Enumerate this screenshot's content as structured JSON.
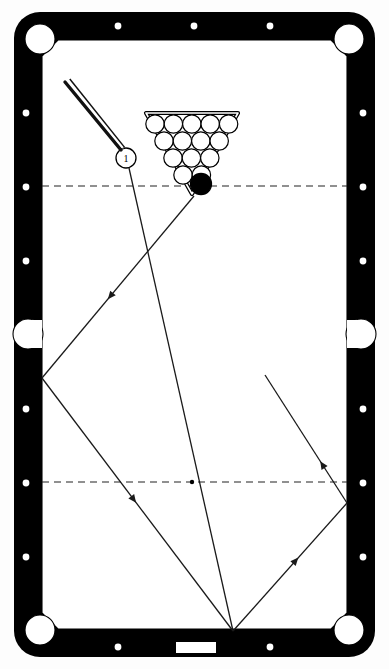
{
  "diagram": {
    "type": "billiards-shot-diagram",
    "colors": {
      "rail": "#000000",
      "cloth": "#ffffff",
      "line": "#1a1a1a",
      "pocket": "#ffffff",
      "diamond": "#ffffff",
      "object_ball": "#000000",
      "cue_ball": "#ffffff"
    }
  },
  "table": {
    "outer": {
      "x": 14,
      "y": 12,
      "width": 361,
      "height": 645,
      "corner_radius": 26
    },
    "rail_thickness": 28,
    "playfield": {
      "x": 42,
      "y": 40,
      "width": 305,
      "height": 589
    },
    "name_plate": {
      "x": 176,
      "y": 642,
      "width": 40,
      "height": 11,
      "label": ""
    }
  },
  "pockets": [
    {
      "name": "top-left-pocket",
      "cx": 40,
      "cy": 39,
      "r": 15,
      "kind": "corner"
    },
    {
      "name": "top-right-pocket",
      "cx": 349,
      "cy": 39,
      "r": 15,
      "kind": "corner"
    },
    {
      "name": "left-side-pocket",
      "cx": 28,
      "cy": 334,
      "r": 15,
      "kind": "side"
    },
    {
      "name": "right-side-pocket",
      "cx": 361,
      "cy": 334,
      "r": 15,
      "kind": "side"
    },
    {
      "name": "bottom-left-pocket",
      "cx": 40,
      "cy": 630,
      "r": 15,
      "kind": "corner"
    },
    {
      "name": "bottom-right-pocket",
      "cx": 349,
      "cy": 630,
      "r": 15,
      "kind": "corner"
    }
  ],
  "diamonds": {
    "top": [
      {
        "cx": 118,
        "cy": 26
      },
      {
        "cx": 194,
        "cy": 26
      },
      {
        "cx": 270,
        "cy": 26
      }
    ],
    "bottom": [
      {
        "cx": 118,
        "cy": 647
      },
      {
        "cx": 270,
        "cy": 647
      }
    ],
    "left": [
      {
        "cx": 26,
        "cy": 113
      },
      {
        "cx": 26,
        "cy": 187
      },
      {
        "cx": 26,
        "cy": 261
      },
      {
        "cx": 26,
        "cy": 409
      },
      {
        "cx": 26,
        "cy": 483
      },
      {
        "cx": 26,
        "cy": 557
      }
    ],
    "right": [
      {
        "cx": 363,
        "cy": 113
      },
      {
        "cx": 363,
        "cy": 187
      },
      {
        "cx": 363,
        "cy": 261
      },
      {
        "cx": 363,
        "cy": 409
      },
      {
        "cx": 363,
        "cy": 483
      },
      {
        "cx": 363,
        "cy": 557
      }
    ]
  },
  "strings": [
    {
      "name": "head-string",
      "y": 186,
      "x1": 42,
      "x2": 347,
      "style": "dashed"
    },
    {
      "name": "foot-string",
      "y": 482,
      "x1": 42,
      "x2": 347,
      "style": "dashed"
    }
  ],
  "spots": [
    {
      "name": "foot-spot",
      "cx": 192,
      "cy": 482,
      "r": 2.2
    }
  ],
  "rack": {
    "name": "ball-rack",
    "orientation": "apex-down",
    "apex": {
      "x": 192,
      "y": 186
    },
    "frame_points": "146,113 238,113 192,194",
    "rows": [
      {
        "count": 5,
        "cy": 124,
        "x_start": 155,
        "spacing": 18.4
      },
      {
        "count": 4,
        "cy": 141,
        "x_start": 164,
        "spacing": 18.4
      },
      {
        "count": 3,
        "cy": 158,
        "x_start": 173,
        "spacing": 18.4
      },
      {
        "count": 2,
        "cy": 175,
        "x_start": 183,
        "spacing": 18.4
      }
    ],
    "ball_radius": 9.2
  },
  "balls": [
    {
      "name": "object-ball-black",
      "label": "",
      "cx": 201,
      "cy": 184,
      "r": 10.5,
      "fill": "#000000"
    },
    {
      "name": "cue-ball",
      "label": "1",
      "cx": 126,
      "cy": 158,
      "r": 10.0,
      "fill": "#ffffff"
    }
  ],
  "cue_stick": {
    "name": "cue-stick",
    "tip": {
      "x": 121,
      "y": 150
    },
    "butt": {
      "x": 65,
      "y": 82
    },
    "width": 3.4
  },
  "shot_path": {
    "name": "shot-trajectory",
    "description": "Cue ball path: rack apex to left rail, to bottom rail, to right rail, back up.",
    "aim_line": {
      "x1": 129,
      "y1": 168,
      "x2": 233,
      "y2": 631
    },
    "segments": [
      {
        "from": {
          "x": 194,
          "y": 196
        },
        "to": {
          "x": 42,
          "y": 378
        },
        "arrow_at": 0.55
      },
      {
        "from": {
          "x": 42,
          "y": 378
        },
        "to": {
          "x": 233,
          "y": 631
        },
        "arrow_at": 0.48
      },
      {
        "from": {
          "x": 233,
          "y": 631
        },
        "to": {
          "x": 347,
          "y": 503
        },
        "arrow_at": 0.55
      },
      {
        "from": {
          "x": 347,
          "y": 503
        },
        "to": {
          "x": 265,
          "y": 375
        },
        "arrow_at": 0.3
      }
    ]
  }
}
